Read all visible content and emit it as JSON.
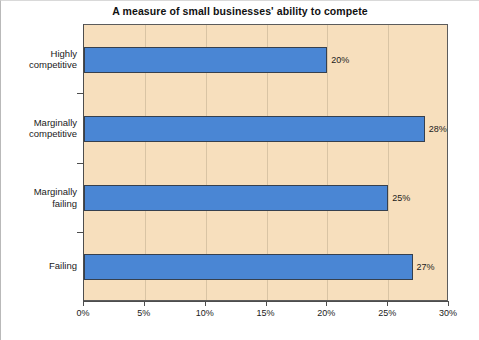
{
  "chart_data": {
    "type": "bar",
    "orientation": "horizontal",
    "title": "A measure of small businesses' ability to compete",
    "xlabel": "",
    "ylabel": "",
    "categories": [
      "Highly competitive",
      "Marginally competitive",
      "Marginally failing",
      "Failing"
    ],
    "category_lines": [
      [
        "Highly",
        "competitive"
      ],
      [
        "Marginally",
        "competitive"
      ],
      [
        "Marginally",
        "failing"
      ],
      [
        "Failing"
      ]
    ],
    "values": [
      20,
      28,
      25,
      27
    ],
    "data_labels": [
      "20%",
      "28%",
      "25%",
      "27%"
    ],
    "xlim": [
      0,
      30
    ],
    "xticks": [
      0,
      5,
      10,
      15,
      20,
      25,
      30
    ],
    "xtick_labels": [
      "0%",
      "5%",
      "10%",
      "15%",
      "20%",
      "25%",
      "30%"
    ],
    "grid": true,
    "legend": null,
    "colors": {
      "bar_fill": "#4a86d4",
      "bar_edge": "#36404e",
      "plot_background": "#f7dfbd",
      "figure_background": "#ffffff",
      "axis": "#4d4d4d",
      "gridline": "#d9c4a4",
      "text": "#1a1a1a"
    }
  }
}
